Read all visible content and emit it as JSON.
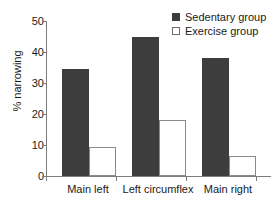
{
  "chart_data": {
    "type": "bar",
    "title": "",
    "xlabel": "",
    "ylabel": "% narrowing",
    "categories": [
      "Main left",
      "Left circumflex",
      "Main right"
    ],
    "series": [
      {
        "name": "Sedentary group",
        "values": [
          34.5,
          45.0,
          38.0
        ],
        "color": "#3d3d3d",
        "style": "filled"
      },
      {
        "name": "Exercise group",
        "values": [
          9.4,
          18.0,
          6.5
        ],
        "color": "#ffffff",
        "style": "open"
      }
    ],
    "ylim": [
      0,
      50
    ],
    "yticks": [
      0,
      10,
      20,
      30,
      40,
      50
    ],
    "ytick_labels": [
      "0",
      "10",
      "20",
      "30",
      "40",
      "50"
    ],
    "grid": false,
    "legend_position": "top-right",
    "annotations": []
  },
  "legend": {
    "entries": [
      {
        "label": "Sedentary group"
      },
      {
        "label": "Exercise group"
      }
    ]
  },
  "axes": {
    "y_title": "% narrowing",
    "y_tick_labels": [
      "50",
      "40",
      "30",
      "20",
      "10",
      "0"
    ],
    "x_tick_labels": [
      "Main left",
      "Left circumflex",
      "Main right"
    ]
  }
}
